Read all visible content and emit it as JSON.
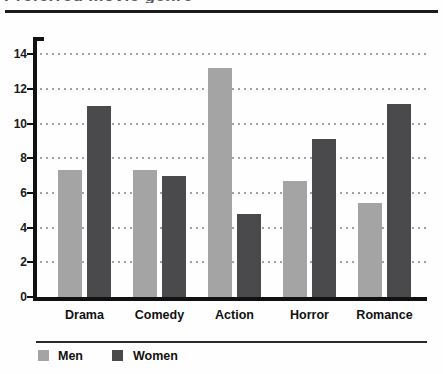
{
  "page": {
    "clipped_title": "Preferred movie genre"
  },
  "chart_data": {
    "type": "bar",
    "categories": [
      "Drama",
      "Comedy",
      "Action",
      "Horror",
      "Romance"
    ],
    "series": [
      {
        "name": "Men",
        "color": "#a4a4a4",
        "values": [
          7.3,
          7.3,
          13.2,
          6.7,
          5.4
        ]
      },
      {
        "name": "Women",
        "color": "#4a4a4c",
        "values": [
          11.0,
          7.0,
          4.8,
          9.1,
          11.1
        ]
      }
    ],
    "xlabel": "",
    "ylabel": "",
    "ylim": [
      0,
      14
    ],
    "yticks": [
      0,
      2,
      4,
      6,
      8,
      10,
      12,
      14
    ],
    "grid": "horizontal-dotted",
    "legend_position": "bottom-left",
    "axis_color": "#111111",
    "gridline_color": "#a2a2a2"
  }
}
